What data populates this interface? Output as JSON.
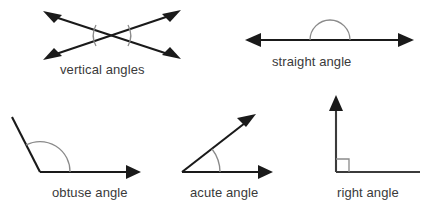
{
  "figure": {
    "background_color": "#ffffff",
    "ray_color": "#1a1a1a",
    "arc_color": "#8a8a8a",
    "label_color": "#3a3a3a"
  },
  "angles": [
    {
      "id": "vertical-angles",
      "label": "vertical angles",
      "description": "Two straight lines crossing in an X shape with arrowheads on all four ends; two arcs mark the pair of opposite (vertical) angles at left and right of the intersection.",
      "arrowhead_count": 4,
      "arc_count": 2
    },
    {
      "id": "straight-angle",
      "label": "straight angle",
      "description": "A single horizontal line with arrowheads on both ends and a semicircular arc above the midpoint.",
      "measure_degrees": 180,
      "arrowhead_count": 2,
      "arc_count": 1
    },
    {
      "id": "obtuse-angle",
      "label": "obtuse angle",
      "description": "A vertex with one ray rising to the upper left and one horizontal ray to the right ending in an arrowhead; a large arc spans the wide opening.",
      "measure_degrees": 117,
      "arrowhead_count": 1,
      "arc_count": 1
    },
    {
      "id": "acute-angle",
      "label": "acute angle",
      "description": "A vertex with one ray angled up to the right and one horizontal ray to the right, both ending in arrowheads; a small arc marks the narrow opening.",
      "measure_degrees": 38,
      "arrowhead_count": 2,
      "arc_count": 1
    },
    {
      "id": "right-angle",
      "label": "right angle",
      "description": "A vertical ray with an arrowhead on top meeting a horizontal line to the right; a small square at the corner marks the ninety degree angle.",
      "measure_degrees": 90,
      "arrowhead_count": 1,
      "arc_count": 0,
      "marker": "square"
    }
  ]
}
